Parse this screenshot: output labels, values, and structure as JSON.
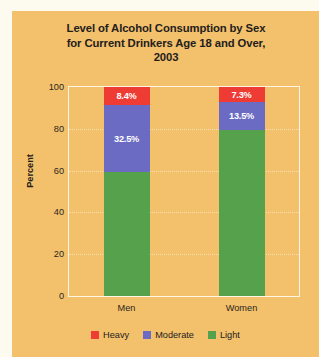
{
  "panel": {
    "background_color": "#f3c16c",
    "border_color": "#fdfbef"
  },
  "chart_data": {
    "type": "bar",
    "subtype": "stacked-percent",
    "title": "Level of Alcohol Consumption by Sex for Current Drinkers Age 18 and Over, 2003",
    "title_lines": [
      "Level of Alcohol Consumption by Sex",
      "for Current Drinkers Age 18 and Over,",
      "2003"
    ],
    "xlabel": "",
    "ylabel": "Percent",
    "categories": [
      "Men",
      "Women"
    ],
    "ylim": [
      0,
      100
    ],
    "yticks": [
      0,
      20,
      40,
      60,
      80,
      100
    ],
    "ytick_labels": [
      "0",
      "20",
      "40",
      "60",
      "80",
      "100"
    ],
    "grid": true,
    "legend_position": "bottom",
    "series": [
      {
        "name": "Heavy",
        "color": "#ee3b33",
        "values": [
          8.4,
          7.3
        ],
        "labels": [
          "8.4%",
          "7.3%"
        ],
        "labels_shown": true
      },
      {
        "name": "Moderate",
        "color": "#6b6bc4",
        "values": [
          32.5,
          13.5
        ],
        "labels": [
          "32.5%",
          "13.5%"
        ],
        "labels_shown": true
      },
      {
        "name": "Light",
        "color": "#56a14b",
        "values": [
          59.1,
          79.2
        ],
        "labels": [
          "",
          ""
        ],
        "labels_shown": false
      }
    ]
  }
}
